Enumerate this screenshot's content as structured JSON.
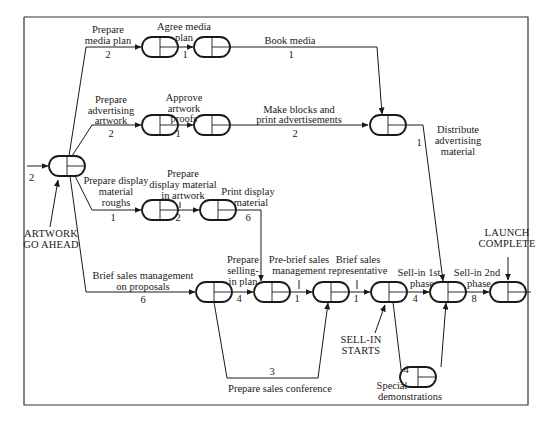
{
  "diagram": {
    "type": "network/critical-path",
    "nodes": [
      {
        "id": "n0",
        "label": "start"
      },
      {
        "id": "n1"
      },
      {
        "id": "n2"
      },
      {
        "id": "n3"
      },
      {
        "id": "n4"
      },
      {
        "id": "n5"
      },
      {
        "id": "n6"
      },
      {
        "id": "n7"
      },
      {
        "id": "n8"
      },
      {
        "id": "n9"
      },
      {
        "id": "n10"
      },
      {
        "id": "n11"
      },
      {
        "id": "n12"
      },
      {
        "id": "n13"
      },
      {
        "id": "n14"
      }
    ],
    "entry": {
      "duration": "2"
    },
    "activities": {
      "prepare_media_plan": {
        "label": [
          "Prepare",
          "media plan"
        ],
        "duration": "2"
      },
      "agree_media_plan": {
        "label": [
          "Agree media",
          "plan"
        ],
        "duration": "1"
      },
      "book_media": {
        "label": [
          "Book media"
        ],
        "duration": "1"
      },
      "prepare_advertising_artwork": {
        "label": [
          "Prepare",
          "advertising",
          "artwork"
        ],
        "duration": "2"
      },
      "approve_artwork_proofs": {
        "label": [
          "Approve",
          "artwork",
          "proofs"
        ],
        "duration": "1"
      },
      "make_blocks": {
        "label": [
          "Make blocks and",
          "print advertisements"
        ],
        "duration": "2"
      },
      "distribute_material": {
        "label": [
          "Distribute",
          "advertising",
          "material"
        ],
        "duration": "1"
      },
      "prepare_display_roughs": {
        "label": [
          "Prepare display",
          "material",
          "roughs"
        ],
        "duration": "1"
      },
      "prepare_display_artwork": {
        "label": [
          "Prepare",
          "display material",
          "in artwork"
        ],
        "duration": "2"
      },
      "print_display_material": {
        "label": [
          "Print display",
          "material"
        ],
        "duration": "6"
      },
      "brief_sales_management": {
        "label": [
          "Brief sales management",
          "on proposals"
        ],
        "duration": "6"
      },
      "prepare_selling_in_plan": {
        "label": [
          "Prepare",
          "selling-",
          "in plan"
        ],
        "duration": "4"
      },
      "pre_brief_sales_management": {
        "label": [
          "Pre-brief sales",
          "management"
        ],
        "duration": "1"
      },
      "brief_sales_representative": {
        "label": [
          "Brief sales",
          "representative"
        ],
        "duration": "1"
      },
      "sell_in_1st_phase": {
        "label": [
          "Sell-in 1st",
          "phase"
        ],
        "duration": "4"
      },
      "sell_in_2nd_phase": {
        "label": [
          "Sell-in 2nd",
          "phase"
        ],
        "duration": "8"
      },
      "prepare_sales_conference": {
        "label": [
          "Prepare sales conference"
        ],
        "duration": "3"
      },
      "special_demonstrations": {
        "label": [
          "Special",
          "demonstrations"
        ],
        "duration": "4"
      }
    },
    "milestones": {
      "artwork_go_ahead": [
        "ARTWORK",
        "GO AHEAD"
      ],
      "sell_in_starts": [
        "SELL-IN",
        "STARTS"
      ],
      "launch_complete": [
        "LAUNCH",
        "COMPLETE"
      ]
    },
    "colors": {
      "line": "#1a1a1a",
      "background": "#ffffff"
    }
  }
}
